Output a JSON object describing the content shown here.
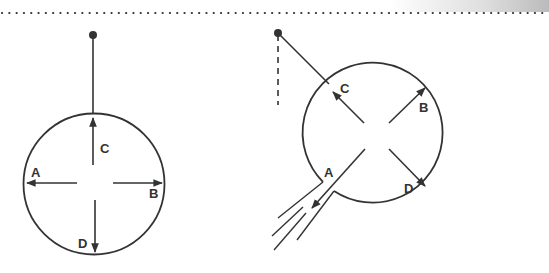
{
  "colors": {
    "line": "#333333",
    "background": "#ffffff",
    "dots": "#333333"
  },
  "diagram": {
    "left_figure": {
      "description": "Circle suspended vertically from pivot, arrows from center",
      "labels": {
        "A": "A",
        "B": "B",
        "C": "C",
        "D": "D"
      }
    },
    "right_figure": {
      "description": "Circle suspended at angle from pivot with vertical dashed reference, jet escaping at A",
      "labels": {
        "A": "A",
        "B": "B",
        "C": "C",
        "D": "D"
      }
    }
  }
}
